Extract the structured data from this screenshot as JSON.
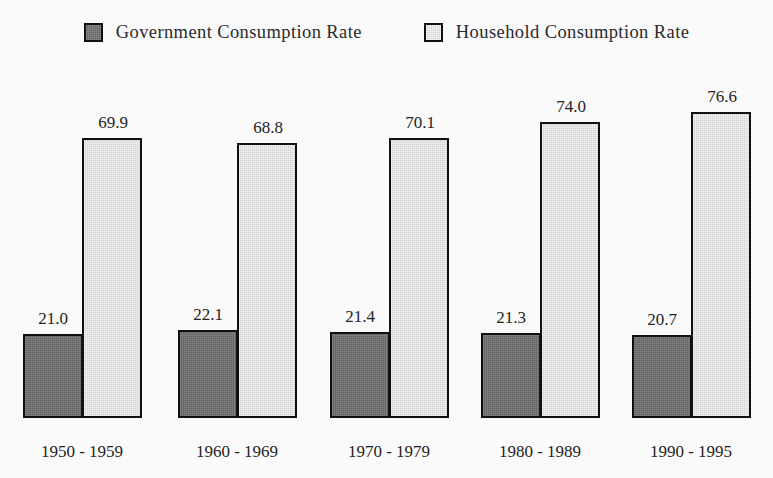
{
  "legend": {
    "entries": [
      {
        "label": "Government Consumption Rate",
        "swatch": "dark-gray-square-icon",
        "color": "#636363"
      },
      {
        "label": "Household Consumption Rate",
        "swatch": "light-gray-square-icon",
        "color": "#d2d2d2"
      }
    ]
  },
  "chart_data": {
    "type": "bar",
    "title": "",
    "subtitle": "",
    "xlabel": "",
    "ylabel": "",
    "grid": false,
    "legend_position": "top-center",
    "ylim": [
      0,
      80
    ],
    "categories": [
      "1950 - 1959",
      "1960 - 1969",
      "1970 - 1979",
      "1980 - 1989",
      "1990 - 1995"
    ],
    "series": [
      {
        "name": "Government Consumption Rate",
        "color": "#636363",
        "values": [
          21.0,
          22.1,
          21.4,
          21.3,
          20.7
        ],
        "labels": [
          "21.0",
          "22.1",
          "21.4",
          "21.3",
          "20.7"
        ]
      },
      {
        "name": "Household Consumption Rate",
        "color": "#d2d2d2",
        "values": [
          69.9,
          68.8,
          70.1,
          74.0,
          76.6
        ],
        "labels": [
          "69.9",
          "68.8",
          "70.1",
          "74.0",
          "76.6"
        ]
      }
    ]
  },
  "style": {
    "background": "#fafafa",
    "bar_border": "#111111",
    "text": "#232323"
  }
}
